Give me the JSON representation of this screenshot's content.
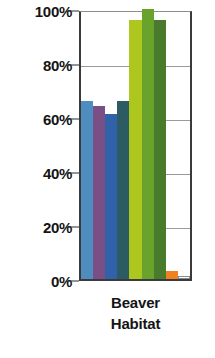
{
  "chart_data": {
    "type": "bar",
    "title": "",
    "subtitle": "",
    "xlabel": "Beaver Habitat",
    "ylabel": "",
    "categories": [
      "Beaver Habitat"
    ],
    "ylim": [
      0,
      100
    ],
    "yticks": [
      0,
      20,
      40,
      60,
      80,
      100
    ],
    "ytick_labels": [
      "0%",
      "20%",
      "40%",
      "60%",
      "80%",
      "100%"
    ],
    "grid": true,
    "legend_position": "none",
    "value_suffix": "%",
    "series": [
      {
        "name": "series-1",
        "values": [
          66
        ],
        "color": "#4f8cc0"
      },
      {
        "name": "series-2",
        "values": [
          64
        ],
        "color": "#7a4f86"
      },
      {
        "name": "series-3",
        "values": [
          61
        ],
        "color": "#2f62a8"
      },
      {
        "name": "series-4",
        "values": [
          66
        ],
        "color": "#2d5b63"
      },
      {
        "name": "series-5",
        "values": [
          96
        ],
        "color": "#aec71e"
      },
      {
        "name": "series-6",
        "values": [
          100
        ],
        "color": "#6aa32b"
      },
      {
        "name": "series-7",
        "values": [
          96
        ],
        "color": "#4a7b2c"
      },
      {
        "name": "series-8",
        "values": [
          3
        ],
        "color": "#f08020"
      },
      {
        "name": "series-9",
        "values": [
          1
        ],
        "color": "#ffffff"
      }
    ]
  },
  "axis": {
    "ticks": [
      {
        "label": "100%",
        "value": 100
      },
      {
        "label": "80%",
        "value": 80
      },
      {
        "label": "60%",
        "value": 60
      },
      {
        "label": "40%",
        "value": 40
      },
      {
        "label": "20%",
        "value": 20
      },
      {
        "label": "0%",
        "value": 0
      }
    ]
  },
  "xcaption": {
    "line1": "Beaver",
    "line2": "Habitat"
  }
}
